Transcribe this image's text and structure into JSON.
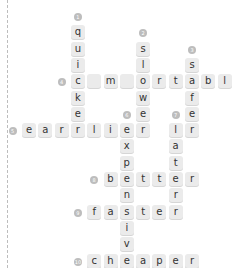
{
  "puzzle": {
    "cell_size": 16.3,
    "origin_x": 6,
    "origin_y": 11,
    "tile_color": "#ebebeb",
    "number_color": "#bdbdbd",
    "clues": [
      {
        "number": "1",
        "direction": "down",
        "answer": "quicker",
        "row": 1,
        "col": 3
      },
      {
        "number": "2",
        "direction": "down",
        "answer": "slower",
        "row": 2,
        "col": 7
      },
      {
        "number": "3",
        "direction": "down",
        "answer": "safer",
        "row": 3,
        "col": 10
      },
      {
        "number": "4",
        "direction": "across",
        "answer": "comfortable",
        "row": 4,
        "col": 3
      },
      {
        "number": "5",
        "direction": "across",
        "answer": "earlier",
        "row": 7,
        "col": 0
      },
      {
        "number": "6",
        "direction": "down",
        "answer": "expensive",
        "row": 7,
        "col": 6
      },
      {
        "number": "7",
        "direction": "down",
        "answer": "later",
        "row": 7,
        "col": 9
      },
      {
        "number": "8",
        "direction": "across",
        "answer": "better",
        "row": 10,
        "col": 5
      },
      {
        "number": "9",
        "direction": "across",
        "answer": "faster",
        "row": 12,
        "col": 4
      },
      {
        "number": "10",
        "direction": "across",
        "answer": "cheaper",
        "row": 14,
        "col": 4
      }
    ],
    "cells": [
      {
        "r": 1,
        "c": 3,
        "t": "q"
      },
      {
        "r": 2,
        "c": 3,
        "t": "u"
      },
      {
        "r": 3,
        "c": 3,
        "t": "i"
      },
      {
        "r": 4,
        "c": 3,
        "t": "c"
      },
      {
        "r": 5,
        "c": 3,
        "t": "k"
      },
      {
        "r": 6,
        "c": 3,
        "t": "e"
      },
      {
        "r": 7,
        "c": 3,
        "t": "r"
      },
      {
        "r": 2,
        "c": 7,
        "t": "s"
      },
      {
        "r": 3,
        "c": 7,
        "t": "l"
      },
      {
        "r": 4,
        "c": 7,
        "t": "o"
      },
      {
        "r": 5,
        "c": 7,
        "t": "w"
      },
      {
        "r": 6,
        "c": 7,
        "t": "e"
      },
      {
        "r": 7,
        "c": 7,
        "t": "r"
      },
      {
        "r": 3,
        "c": 10,
        "t": "s"
      },
      {
        "r": 4,
        "c": 10,
        "t": "a"
      },
      {
        "r": 5,
        "c": 10,
        "t": "f"
      },
      {
        "r": 6,
        "c": 10,
        "t": "e"
      },
      {
        "r": 7,
        "c": 10,
        "t": "r"
      },
      {
        "r": 4,
        "c": 4,
        "t": ""
      },
      {
        "r": 4,
        "c": 5,
        "t": "m"
      },
      {
        "r": 4,
        "c": 6,
        "t": ""
      },
      {
        "r": 4,
        "c": 8,
        "t": "r"
      },
      {
        "r": 4,
        "c": 9,
        "t": "t"
      },
      {
        "r": 4,
        "c": 11,
        "t": "b"
      },
      {
        "r": 4,
        "c": 12,
        "t": "l"
      },
      {
        "r": 4,
        "c": 13,
        "t": "e"
      },
      {
        "r": 7,
        "c": 0,
        "t": "e"
      },
      {
        "r": 7,
        "c": 1,
        "t": "a"
      },
      {
        "r": 7,
        "c": 2,
        "t": "r"
      },
      {
        "r": 7,
        "c": 4,
        "t": "l"
      },
      {
        "r": 7,
        "c": 5,
        "t": "i"
      },
      {
        "r": 7,
        "c": 6,
        "t": "e"
      },
      {
        "r": 8,
        "c": 6,
        "t": "x"
      },
      {
        "r": 9,
        "c": 6,
        "t": "p"
      },
      {
        "r": 10,
        "c": 6,
        "t": "e"
      },
      {
        "r": 11,
        "c": 6,
        "t": "n"
      },
      {
        "r": 12,
        "c": 6,
        "t": "s"
      },
      {
        "r": 13,
        "c": 6,
        "t": "i"
      },
      {
        "r": 14,
        "c": 6,
        "t": "v"
      },
      {
        "r": 15,
        "c": 6,
        "t": "e"
      },
      {
        "r": 7,
        "c": 9,
        "t": "l"
      },
      {
        "r": 8,
        "c": 9,
        "t": "a"
      },
      {
        "r": 9,
        "c": 9,
        "t": "t"
      },
      {
        "r": 10,
        "c": 9,
        "t": "e"
      },
      {
        "r": 11,
        "c": 9,
        "t": "r"
      },
      {
        "r": 12,
        "c": 9,
        "t": "r"
      },
      {
        "r": 10,
        "c": 5,
        "t": "b"
      },
      {
        "r": 10,
        "c": 7,
        "t": "t"
      },
      {
        "r": 10,
        "c": 8,
        "t": "t"
      },
      {
        "r": 10,
        "c": 10,
        "t": "r"
      },
      {
        "r": 12,
        "c": 4,
        "t": "f"
      },
      {
        "r": 12,
        "c": 5,
        "t": "a"
      },
      {
        "r": 12,
        "c": 7,
        "t": "t"
      },
      {
        "r": 12,
        "c": 8,
        "t": "e"
      },
      {
        "r": 15,
        "c": 4,
        "t": "c"
      },
      {
        "r": 15,
        "c": 5,
        "t": "h"
      },
      {
        "r": 15,
        "c": 7,
        "t": "a"
      },
      {
        "r": 15,
        "c": 8,
        "t": "p"
      },
      {
        "r": 15,
        "c": 9,
        "t": "e"
      },
      {
        "r": 15,
        "c": 10,
        "t": "r"
      }
    ],
    "numbers": [
      {
        "n": "1",
        "r": 0,
        "c": 3
      },
      {
        "n": "2",
        "r": 1,
        "c": 7
      },
      {
        "n": "3",
        "r": 2,
        "c": 10
      },
      {
        "n": "4",
        "r": 4,
        "c": 2
      },
      {
        "n": "5",
        "r": 7,
        "c": -1
      },
      {
        "n": "6",
        "r": 6,
        "c": 6
      },
      {
        "n": "7",
        "r": 6,
        "c": 9
      },
      {
        "n": "8",
        "r": 10,
        "c": 4
      },
      {
        "n": "9",
        "r": 12,
        "c": 3
      },
      {
        "n": "10",
        "r": 15,
        "c": 3
      }
    ]
  }
}
